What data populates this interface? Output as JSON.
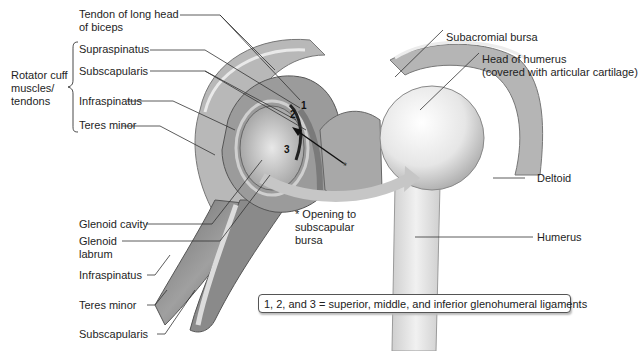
{
  "figure": {
    "left_labels": {
      "tendon_biceps": [
        "Tendon of long head",
        "of biceps"
      ],
      "group_label": [
        "Rotator cuff",
        "muscles/",
        "tendons"
      ],
      "supraspinatus": "Supraspinatus",
      "subscapularis_top": "Subscapularis",
      "infraspinatus_top": "Infraspinatus",
      "teres_minor_top": "Teres minor",
      "glenoid_cavity": "Glenoid cavity",
      "glenoid_labrum": [
        "Glenoid",
        "labrum"
      ],
      "infraspinatus_bottom": "Infraspinatus",
      "teres_minor_bottom": "Teres minor",
      "subscapularis_bottom": "Subscapularis"
    },
    "right_labels": {
      "subacromial_bursa": "Subacromial bursa",
      "head_of_humerus": [
        "Head of humerus",
        "(covered with articular cartilage)"
      ],
      "deltoid": "Deltoid",
      "humerus": "Humerus"
    },
    "center_labels": {
      "opening": [
        "* Opening to",
        "subscapular",
        "bursa"
      ],
      "ligament_numbers": [
        "1",
        "2",
        "3"
      ],
      "asterisk": "*"
    },
    "legend": "1, 2, and 3 = superior, middle, and inferior glenohumeral ligaments"
  }
}
